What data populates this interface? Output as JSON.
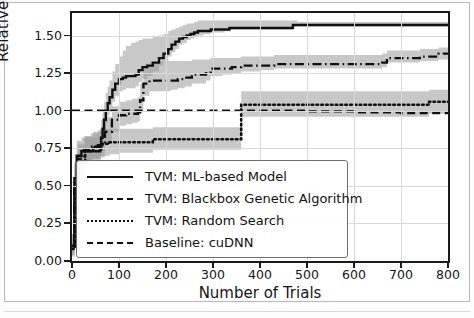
{
  "figure": {
    "background": "#ffffff",
    "frame_color": "#b9b9b9"
  },
  "chart_data": {
    "type": "line",
    "title": "",
    "xlabel": "Number of Trials",
    "ylabel": "Relative Speedup",
    "xlim": [
      0,
      800
    ],
    "ylim": [
      0.0,
      1.65
    ],
    "xticks": [
      0,
      100,
      200,
      300,
      400,
      500,
      600,
      700,
      800
    ],
    "xtick_labels": [
      "0",
      "100",
      "200",
      "300",
      "400",
      "500",
      "600",
      "700",
      "800"
    ],
    "yticks": [
      0.0,
      0.25,
      0.5,
      0.75,
      1.0,
      1.25,
      1.5
    ],
    "ytick_labels": [
      "0.00",
      "0.25",
      "0.50",
      "0.75",
      "1.00",
      "1.25",
      "1.50"
    ],
    "grid": true,
    "legend_position": "lower center",
    "band_color": "#9a9a9a",
    "band_opacity": 0.55,
    "line_color": "#101010",
    "series": [
      {
        "name": "TVM: ML-based Model",
        "style": "solid",
        "x": [
          0,
          5,
          10,
          20,
          40,
          55,
          60,
          62,
          65,
          68,
          72,
          76,
          80,
          86,
          92,
          100,
          108,
          115,
          125,
          135,
          142,
          150,
          160,
          172,
          185,
          195,
          205,
          212,
          220,
          228,
          236,
          244,
          252,
          260,
          268,
          280,
          295,
          310,
          325,
          335,
          345,
          400,
          470,
          480,
          600,
          700,
          800
        ],
        "y": [
          0.1,
          0.55,
          0.7,
          0.73,
          0.73,
          0.73,
          0.74,
          0.82,
          0.88,
          0.94,
          1.0,
          1.05,
          1.09,
          1.14,
          1.18,
          1.21,
          1.22,
          1.23,
          1.23,
          1.24,
          1.27,
          1.29,
          1.3,
          1.32,
          1.35,
          1.38,
          1.41,
          1.44,
          1.46,
          1.48,
          1.49,
          1.5,
          1.51,
          1.52,
          1.53,
          1.53,
          1.54,
          1.54,
          1.54,
          1.55,
          1.55,
          1.55,
          1.57,
          1.57,
          1.57,
          1.57,
          1.57
        ],
        "band_low": [
          0.05,
          0.42,
          0.6,
          0.66,
          0.66,
          0.66,
          0.66,
          0.74,
          0.8,
          0.86,
          0.92,
          0.97,
          1.01,
          1.06,
          1.1,
          1.13,
          1.14,
          1.15,
          1.15,
          1.16,
          1.19,
          1.21,
          1.23,
          1.26,
          1.3,
          1.33,
          1.36,
          1.39,
          1.41,
          1.44,
          1.45,
          1.47,
          1.48,
          1.49,
          1.5,
          1.51,
          1.52,
          1.52,
          1.53,
          1.54,
          1.54,
          1.54,
          1.56,
          1.56,
          1.56,
          1.56,
          1.56
        ],
        "band_high": [
          0.18,
          0.66,
          0.8,
          0.82,
          0.82,
          0.83,
          0.86,
          0.94,
          1.0,
          1.06,
          1.12,
          1.16,
          1.2,
          1.26,
          1.31,
          1.36,
          1.4,
          1.43,
          1.45,
          1.46,
          1.47,
          1.48,
          1.48,
          1.49,
          1.5,
          1.51,
          1.53,
          1.54,
          1.55,
          1.56,
          1.57,
          1.58,
          1.58,
          1.59,
          1.6,
          1.6,
          1.6,
          1.6,
          1.6,
          1.6,
          1.6,
          1.6,
          1.6,
          1.59,
          1.59,
          1.59,
          1.59
        ],
        "final_value": 1.57
      },
      {
        "name": "TVM: Blackbox Genetic Algorithm",
        "style": "dashdot",
        "x": [
          0,
          5,
          12,
          25,
          40,
          55,
          70,
          85,
          100,
          115,
          128,
          140,
          145,
          152,
          165,
          180,
          195,
          210,
          225,
          240,
          255,
          270,
          285,
          295,
          305,
          320,
          340,
          360,
          380,
          400,
          430,
          470,
          510,
          560,
          610,
          660,
          670,
          700,
          740,
          780,
          800
        ],
        "y": [
          0.1,
          0.52,
          0.68,
          0.74,
          0.76,
          0.77,
          0.86,
          0.94,
          0.97,
          0.98,
          0.98,
          0.99,
          1.07,
          1.18,
          1.2,
          1.2,
          1.2,
          1.2,
          1.21,
          1.22,
          1.24,
          1.24,
          1.25,
          1.28,
          1.28,
          1.28,
          1.29,
          1.3,
          1.3,
          1.3,
          1.31,
          1.31,
          1.31,
          1.31,
          1.31,
          1.32,
          1.35,
          1.35,
          1.36,
          1.38,
          1.38
        ],
        "band_low": [
          0.04,
          0.4,
          0.58,
          0.66,
          0.68,
          0.69,
          0.78,
          0.86,
          0.9,
          0.91,
          0.92,
          0.93,
          0.99,
          1.1,
          1.13,
          1.13,
          1.13,
          1.14,
          1.15,
          1.16,
          1.18,
          1.18,
          1.2,
          1.23,
          1.23,
          1.24,
          1.25,
          1.26,
          1.26,
          1.27,
          1.28,
          1.28,
          1.28,
          1.28,
          1.28,
          1.29,
          1.32,
          1.32,
          1.33,
          1.34,
          1.34
        ],
        "band_high": [
          0.18,
          0.64,
          0.78,
          0.83,
          0.85,
          0.87,
          0.96,
          1.03,
          1.06,
          1.07,
          1.08,
          1.09,
          1.18,
          1.3,
          1.32,
          1.33,
          1.33,
          1.33,
          1.33,
          1.33,
          1.34,
          1.34,
          1.34,
          1.35,
          1.35,
          1.35,
          1.35,
          1.36,
          1.36,
          1.36,
          1.37,
          1.37,
          1.37,
          1.37,
          1.37,
          1.38,
          1.4,
          1.4,
          1.41,
          1.42,
          1.42
        ],
        "final_value": 1.38
      },
      {
        "name": "TVM: Random Search",
        "style": "dotted",
        "x": [
          0,
          6,
          14,
          28,
          45,
          60,
          80,
          100,
          120,
          140,
          160,
          172,
          180,
          200,
          240,
          280,
          320,
          355,
          360,
          400,
          450,
          500,
          550,
          600,
          650,
          700,
          740,
          760,
          780,
          800
        ],
        "y": [
          0.08,
          0.5,
          0.66,
          0.73,
          0.76,
          0.78,
          0.79,
          0.79,
          0.79,
          0.79,
          0.79,
          0.81,
          0.81,
          0.81,
          0.81,
          0.81,
          0.81,
          0.81,
          1.04,
          1.04,
          1.04,
          1.04,
          1.04,
          1.04,
          1.04,
          1.04,
          1.04,
          1.06,
          1.06,
          1.06
        ],
        "band_low": [
          0.03,
          0.38,
          0.56,
          0.64,
          0.68,
          0.7,
          0.71,
          0.72,
          0.72,
          0.72,
          0.72,
          0.74,
          0.74,
          0.74,
          0.74,
          0.74,
          0.74,
          0.74,
          0.96,
          0.96,
          0.96,
          0.96,
          0.96,
          0.96,
          0.96,
          0.96,
          0.96,
          0.98,
          0.98,
          0.98
        ],
        "band_high": [
          0.15,
          0.62,
          0.76,
          0.83,
          0.86,
          0.88,
          0.88,
          0.88,
          0.88,
          0.88,
          0.88,
          0.89,
          0.89,
          0.89,
          0.89,
          0.89,
          0.89,
          0.89,
          1.13,
          1.13,
          1.13,
          1.13,
          1.13,
          1.13,
          1.13,
          1.13,
          1.13,
          1.14,
          1.14,
          1.14
        ],
        "final_value": 1.06
      },
      {
        "name": "Baseline: cuDNN",
        "style": "dashed",
        "x": [
          0,
          100,
          200,
          300,
          400,
          500,
          600,
          700,
          800
        ],
        "y": [
          1.0,
          1.0,
          1.0,
          1.0,
          1.0,
          0.995,
          0.99,
          0.985,
          0.98
        ],
        "final_value": 0.98
      }
    ]
  },
  "legend": {
    "entries": [
      {
        "label": "TVM: ML-based Model",
        "style": "solid"
      },
      {
        "label": "TVM: Blackbox Genetic Algorithm",
        "style": "dashdot"
      },
      {
        "label": "TVM: Random Search",
        "style": "dotted"
      },
      {
        "label": "Baseline: cuDNN",
        "style": "dashed"
      }
    ]
  }
}
